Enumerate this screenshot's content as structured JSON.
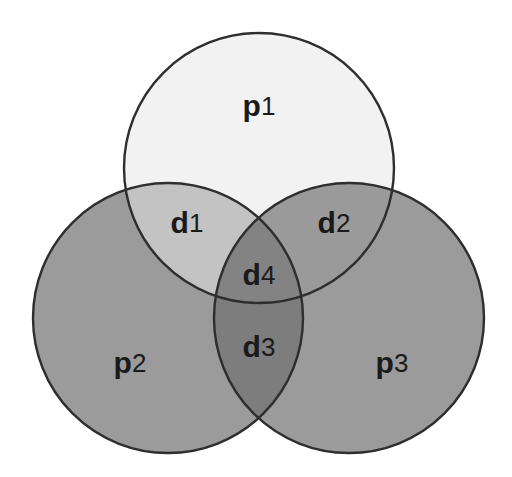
{
  "diagram": {
    "type": "venn",
    "background_color": "#ffffff",
    "outline_color": "#2e2e2e",
    "label_color": "#1a1a1a",
    "sets": [
      {
        "id": "p1",
        "label_base": "p",
        "label_sub": "1",
        "label_full": "p1",
        "fill_color": "#f2f2f2",
        "cx": 259,
        "cy": 168,
        "r": 135,
        "label_x": 259,
        "label_y": 108
      },
      {
        "id": "p2",
        "label_base": "p",
        "label_sub": "2",
        "label_full": "p2",
        "fill_color": "#9b9b9b",
        "cx": 168,
        "cy": 318,
        "r": 135,
        "label_x": 130,
        "label_y": 365
      },
      {
        "id": "p3",
        "label_base": "p",
        "label_sub": "3",
        "label_full": "p3",
        "fill_color": "#9b9b9b",
        "cx": 349,
        "cy": 318,
        "r": 135,
        "label_x": 392,
        "label_y": 365
      }
    ],
    "intersections": [
      {
        "id": "d1",
        "label_base": "d",
        "label_sub": "1",
        "label_full": "d1",
        "of": [
          "p1",
          "p2"
        ],
        "fill_color": "#c3c3c3",
        "label_x": 187,
        "label_y": 225
      },
      {
        "id": "d2",
        "label_base": "d",
        "label_sub": "2",
        "label_full": "d2",
        "of": [
          "p1",
          "p3"
        ],
        "fill_color": "#9a9a9a",
        "label_x": 334,
        "label_y": 225
      },
      {
        "id": "d3",
        "label_base": "d",
        "label_sub": "3",
        "label_full": "d3",
        "of": [
          "p2",
          "p3"
        ],
        "fill_color": "#7d7d7d",
        "label_x": 259,
        "label_y": 349
      },
      {
        "id": "d4",
        "label_base": "d",
        "label_sub": "4",
        "label_full": "d4",
        "of": [
          "p1",
          "p2",
          "p3"
        ],
        "fill_color": "#838383",
        "label_x": 259,
        "label_y": 277
      }
    ]
  }
}
